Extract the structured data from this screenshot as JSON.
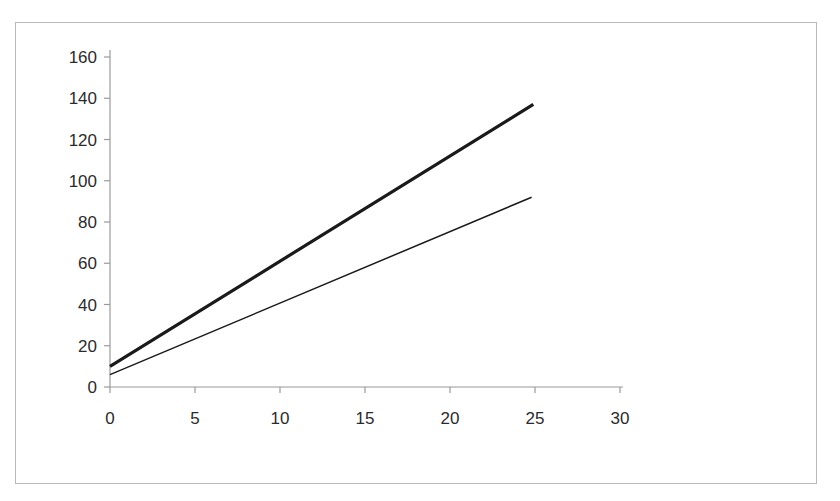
{
  "figure": {
    "background_color": "#ffffff",
    "border_color": "#b9b9b9",
    "axis_color": "#9a9a9a",
    "line_color": "#1a1a1a"
  },
  "chart_data": {
    "type": "line",
    "title": "",
    "subtitle": "",
    "xlabel": "",
    "ylabel": "",
    "xlim": [
      0,
      30
    ],
    "ylim": [
      0,
      160
    ],
    "xticks": [
      0,
      5,
      10,
      15,
      20,
      25,
      30
    ],
    "yticks": [
      0,
      20,
      40,
      60,
      80,
      100,
      120,
      140,
      160
    ],
    "xtick_labels": [
      "0",
      "5",
      "10",
      "15",
      "20",
      "25",
      "30"
    ],
    "ytick_labels": [
      "0",
      "20",
      "40",
      "60",
      "80",
      "100",
      "120",
      "140",
      "160"
    ],
    "grid": false,
    "legend": null,
    "legend_position": "none",
    "annotations": [],
    "series": [
      {
        "name": "thick-series",
        "style": "solid",
        "line_width": 3.2,
        "color": "#1a1a1a",
        "x": [
          0,
          24.9
        ],
        "y": [
          10,
          137
        ],
        "slope": 5.1,
        "intercept": 10
      },
      {
        "name": "thin-series",
        "style": "solid",
        "line_width": 1.5,
        "color": "#1a1a1a",
        "x": [
          0,
          24.8
        ],
        "y": [
          6,
          92
        ],
        "slope": 3.47,
        "intercept": 6
      }
    ]
  }
}
